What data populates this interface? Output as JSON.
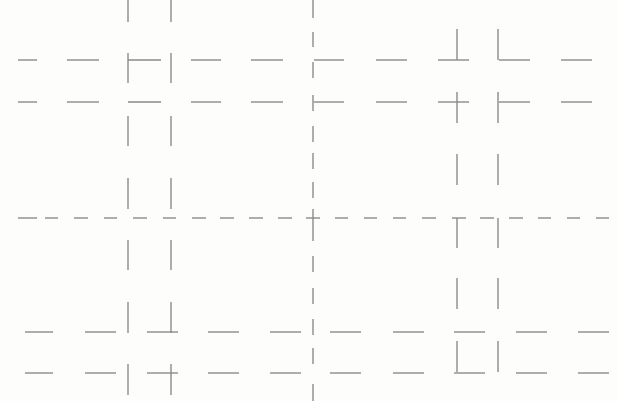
{
  "diagram": {
    "type": "line-fragment-grid",
    "background": "#fdfdfc",
    "stroke_color": "#8a8a8a",
    "stroke_width": 1.4,
    "axes": {
      "center_vertical_x": 313,
      "center_horizontal_y": 218,
      "vertical_dashes": [
        [
          0,
          18
        ],
        [
          32,
          47
        ],
        [
          62,
          78
        ],
        [
          95,
          111
        ],
        [
          126,
          142
        ],
        [
          153,
          169
        ],
        [
          182,
          198
        ],
        [
          209,
          211
        ],
        [
          225,
          241
        ],
        [
          256,
          272
        ],
        [
          288,
          304
        ],
        [
          319,
          335
        ],
        [
          348,
          364
        ],
        [
          384,
          401
        ]
      ],
      "horizontal_dashes": [
        [
          18,
          37
        ],
        [
          45,
          58
        ],
        [
          74,
          88
        ],
        [
          104,
          117
        ],
        [
          133,
          147
        ],
        [
          163,
          176
        ],
        [
          192,
          206
        ],
        [
          220,
          234
        ],
        [
          249,
          263
        ],
        [
          278,
          292
        ],
        [
          335,
          348
        ],
        [
          364,
          377
        ],
        [
          393,
          406
        ],
        [
          422,
          436
        ],
        [
          452,
          466
        ],
        [
          480,
          494
        ],
        [
          509,
          523
        ],
        [
          538,
          551
        ],
        [
          567,
          580
        ],
        [
          596,
          609
        ]
      ],
      "cross_at_origin": {
        "x": 313,
        "y": 218,
        "size": 7
      }
    },
    "horizontal_rows": [
      {
        "y": 60,
        "segments": [
          [
            18,
            37
          ],
          [
            67,
            99
          ],
          [
            128,
            161
          ],
          [
            191,
            221
          ],
          [
            251,
            283
          ],
          [
            314,
            344
          ],
          [
            376,
            407
          ],
          [
            438,
            469
          ],
          [
            499,
            530
          ],
          [
            561,
            592
          ]
        ]
      },
      {
        "y": 102,
        "segments": [
          [
            18,
            37
          ],
          [
            67,
            99
          ],
          [
            128,
            161
          ],
          [
            191,
            221
          ],
          [
            251,
            283
          ],
          [
            314,
            344
          ],
          [
            376,
            407
          ],
          [
            438,
            469
          ],
          [
            499,
            530
          ],
          [
            561,
            592
          ]
        ]
      },
      {
        "y": 332,
        "segments": [
          [
            25,
            53
          ],
          [
            85,
            116
          ],
          [
            147,
            178
          ],
          [
            208,
            239
          ],
          [
            270,
            301
          ],
          [
            330,
            361
          ],
          [
            393,
            424
          ],
          [
            454,
            485
          ],
          [
            516,
            547
          ],
          [
            578,
            609
          ]
        ]
      },
      {
        "y": 373,
        "segments": [
          [
            25,
            53
          ],
          [
            85,
            116
          ],
          [
            147,
            178
          ],
          [
            208,
            239
          ],
          [
            270,
            301
          ],
          [
            330,
            361
          ],
          [
            393,
            424
          ],
          [
            454,
            485
          ],
          [
            516,
            547
          ],
          [
            578,
            609
          ]
        ]
      }
    ],
    "vertical_columns": [
      {
        "x": 128,
        "segments": [
          [
            0,
            22
          ],
          [
            53,
            83
          ],
          [
            116,
            146
          ],
          [
            178,
            209
          ],
          [
            240,
            270
          ],
          [
            302,
            333
          ],
          [
            364,
            395
          ]
        ]
      },
      {
        "x": 171,
        "segments": [
          [
            0,
            22
          ],
          [
            53,
            83
          ],
          [
            116,
            146
          ],
          [
            178,
            209
          ],
          [
            240,
            270
          ],
          [
            302,
            333
          ],
          [
            364,
            395
          ]
        ]
      },
      {
        "x": 457,
        "segments": [
          [
            29,
            60
          ],
          [
            92,
            123
          ],
          [
            154,
            185
          ],
          [
            218,
            248
          ],
          [
            278,
            309
          ],
          [
            341,
            372
          ]
        ]
      },
      {
        "x": 498,
        "segments": [
          [
            29,
            60
          ],
          [
            92,
            123
          ],
          [
            154,
            185
          ],
          [
            218,
            248
          ],
          [
            278,
            309
          ],
          [
            341,
            372
          ]
        ]
      }
    ]
  }
}
